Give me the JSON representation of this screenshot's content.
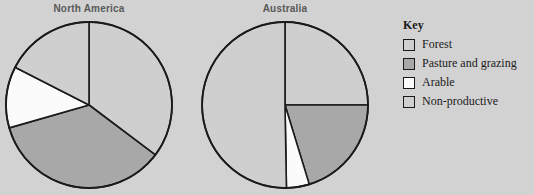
{
  "background_color": "#d2d2d2",
  "colors": {
    "forest": "#cfcfcf",
    "pasture_and_grazing": "#a8a8a8",
    "arable": "#fbfbfb",
    "non_productive": "#cfcfcf",
    "outline": "#1a1a1a",
    "title_text": "#595959",
    "legend_text": "#1a1a1a"
  },
  "legend": {
    "title": "Key",
    "items": [
      {
        "label": "Forest",
        "key": "forest",
        "color": "#cfcfcf"
      },
      {
        "label": "Pasture and grazing",
        "key": "pasture_and_grazing",
        "color": "#a8a8a8"
      },
      {
        "label": "Arable",
        "key": "arable",
        "color": "#fbfbfb"
      },
      {
        "label": "Non-productive",
        "key": "non_productive",
        "color": "#cfcfcf"
      }
    ]
  },
  "charts": [
    {
      "id": "north-america",
      "title": "North America",
      "cx": 89,
      "cy": 105,
      "r": 83,
      "slices": [
        {
          "label": "Forest",
          "start": 0,
          "end": 127,
          "color": "#cfcfcf",
          "percent": 35
        },
        {
          "label": "Pasture and grazing",
          "start": 127,
          "end": 254,
          "color": "#a8a8a8",
          "percent": 35
        },
        {
          "label": "Arable",
          "start": 254,
          "end": 297,
          "color": "#fbfbfb",
          "percent": 12
        },
        {
          "label": "Non-productive",
          "start": 297,
          "end": 360,
          "color": "#cfcfcf",
          "percent": 18
        }
      ]
    },
    {
      "id": "australia",
      "title": "Australia",
      "cx": 285,
      "cy": 105,
      "r": 83,
      "slices": [
        {
          "label": "Forest",
          "start": 0,
          "end": 90,
          "color": "#cfcfcf",
          "percent": 25
        },
        {
          "label": "Pasture and grazing",
          "start": 90,
          "end": 163,
          "color": "#a8a8a8",
          "percent": 20
        },
        {
          "label": "Arable",
          "start": 163,
          "end": 179,
          "color": "#fbfbfb",
          "percent": 4
        },
        {
          "label": "Non-productive",
          "start": 179,
          "end": 360,
          "color": "#cfcfcf",
          "percent": 51
        }
      ]
    }
  ],
  "chart_data": {
    "type": "pie",
    "title": "",
    "multiple": true,
    "legend_position": "right",
    "legend_title": "Key",
    "categories": [
      "Forest",
      "Pasture and grazing",
      "Arable",
      "Non-productive"
    ],
    "unit": "percent",
    "series": [
      {
        "name": "North America",
        "values": [
          35,
          35,
          12,
          18
        ]
      },
      {
        "name": "Australia",
        "values": [
          25,
          20,
          4,
          51
        ]
      }
    ],
    "slice_angles_deg_clockwise_from_top": {
      "North America": [
        [
          0,
          127
        ],
        [
          127,
          254
        ],
        [
          254,
          297
        ],
        [
          297,
          360
        ]
      ],
      "Australia": [
        [
          0,
          90
        ],
        [
          90,
          163
        ],
        [
          163,
          179
        ],
        [
          179,
          360
        ]
      ]
    },
    "colors": [
      "#cfcfcf",
      "#a8a8a8",
      "#fbfbfb",
      "#cfcfcf"
    ]
  }
}
